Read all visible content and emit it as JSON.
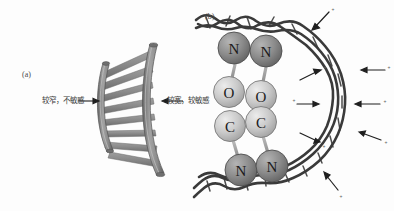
{
  "figure": {
    "background_color": "#fdfdfd",
    "width": 394,
    "height": 211
  },
  "panel_a": {
    "tag": "(a)",
    "description": "curved ladder-like band with two arcs and transverse rungs",
    "left_label": "较窄，不敏感",
    "right_label": "较宽，较敏感",
    "colors": {
      "rail": "#8e8e8e",
      "rail_edge": "#5a5a5a",
      "rung": "#8a8a8a",
      "rung_edge": "#6b6b6b"
    },
    "rung_count": 8,
    "arrow_left": "→",
    "arrow_right": "←"
  },
  "panel_b": {
    "tag": "(b)",
    "description": "open loop of twisted dark cord with eight labelled spheres and radiating arrows",
    "atoms": [
      {
        "label": "N",
        "shade": "dark"
      },
      {
        "label": "N",
        "shade": "dark"
      },
      {
        "label": "O",
        "shade": "light"
      },
      {
        "label": "O",
        "shade": "light"
      },
      {
        "label": "C",
        "shade": "light"
      },
      {
        "label": "C",
        "shade": "light"
      },
      {
        "label": "N",
        "shade": "dark"
      },
      {
        "label": "N",
        "shade": "dark"
      }
    ],
    "arrow_marks": [
      "+",
      "+",
      "+",
      "+",
      "+",
      "+",
      "+",
      "+"
    ],
    "arrow_count": 8,
    "colors": {
      "atom_dark": "#8c8c8c",
      "atom_dark_edge": "#4f4f4f",
      "atom_light": "#c9c9c9",
      "atom_light_edge": "#7a7a7a",
      "cord": "#3a3a3a",
      "arrow": "#1f1f1f"
    }
  }
}
